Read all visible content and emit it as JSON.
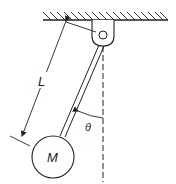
{
  "diagram": {
    "labels": {
      "length": "L",
      "mass": "M",
      "angle": "θ"
    },
    "colors": {
      "stroke": "#222222",
      "background": "#ffffff"
    }
  }
}
